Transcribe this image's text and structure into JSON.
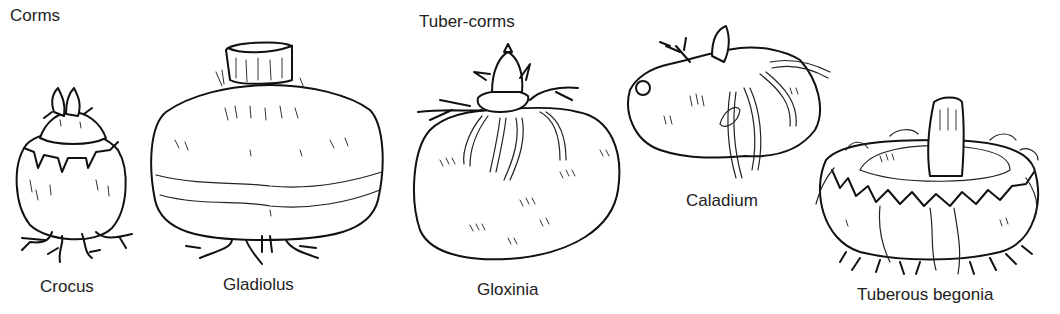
{
  "groups": [
    {
      "heading": "Corms",
      "items": [
        "Crocus",
        "Gladiolus"
      ]
    },
    {
      "heading": "Tuber-corms",
      "items": [
        "Gloxinia",
        "Caladium",
        "Tuberous begonia"
      ]
    }
  ],
  "labels": {
    "corms_heading": "Corms",
    "tuber_corms_heading": "Tuber-corms",
    "crocus": "Crocus",
    "gladiolus": "Gladiolus",
    "gloxinia": "Gloxinia",
    "caladium": "Caladium",
    "tuberous_begonia": "Tuberous begonia"
  },
  "colors": {
    "ink": "#111111",
    "background": "#ffffff"
  }
}
